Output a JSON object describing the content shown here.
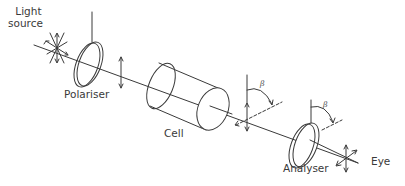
{
  "diagram": {
    "labels": {
      "light_source_line1": "Light",
      "light_source_line2": "source",
      "polariser": "Polariser",
      "cell": "Cell",
      "analyser": "Analyser",
      "eye": "Eye"
    },
    "angles": {
      "after_cell": "β",
      "at_analyser": "β"
    },
    "colors": {
      "stroke": "#3a3a3a",
      "background": "#ffffff"
    }
  }
}
